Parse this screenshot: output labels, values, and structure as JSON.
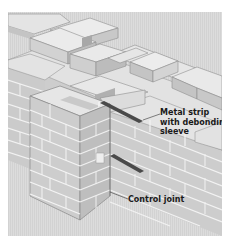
{
  "diagram": {
    "labels": {
      "metal_strip_line1": "Metal strip",
      "metal_strip_line2": "with debonding",
      "metal_strip_line3": "sleeve",
      "control_joint": "Control joint"
    },
    "colors": {
      "background": "#ffffff",
      "frame": "#dedede",
      "brick_top": "#e4e4e4",
      "brick_face_light": "#cfcfcf",
      "brick_face_dark": "#b4b4b4",
      "mortar": "#f4f4f4",
      "outline": "#8a8a8a",
      "metal_strip": "#4a4a4a",
      "label_text": "#1a1a1a"
    }
  }
}
